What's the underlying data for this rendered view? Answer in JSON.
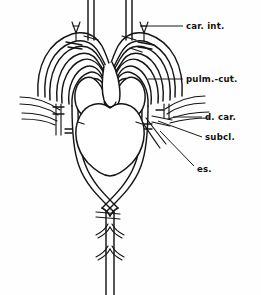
{
  "figure": {
    "background_color": "#fefefe",
    "line_color": "#151515",
    "width": 261,
    "height": 295
  },
  "labels": [
    {
      "id": "car-int",
      "text": "car. int.",
      "x": 186,
      "y": 26,
      "leader_from_x": 183,
      "leader_from_y": 26,
      "leader_to_x": 140,
      "leader_to_y": 26
    },
    {
      "id": "pulm-cut",
      "text": "pulm.-cut.",
      "x": 186,
      "y": 79,
      "leader_from_x": 183,
      "leader_from_y": 79,
      "leader_to_x": 148,
      "leader_to_y": 79
    },
    {
      "id": "d-car",
      "text": "d. car.",
      "x": 205,
      "y": 117,
      "leader_from_x": 202,
      "leader_from_y": 117,
      "leader_to_x": 173,
      "leader_to_y": 117
    },
    {
      "id": "subcl",
      "text": "subcl.",
      "x": 205,
      "y": 137,
      "leader_from_x": 202,
      "leader_from_y": 137,
      "leader_to_x": 158,
      "leader_to_y": 121
    },
    {
      "id": "es",
      "text": "es.",
      "x": 197,
      "y": 169,
      "leader_from_x": 194,
      "leader_from_y": 166,
      "leader_to_x": 160,
      "leader_to_y": 131
    }
  ],
  "structures": {
    "heart_ventricle": "ventricle",
    "heart_left_atrium": "left-atrium",
    "heart_right_atrium": "right-atrium",
    "conus_arteriosus": "conus-arteriosus",
    "dorsal_aorta": "dorsal-aorta",
    "aortic_arches": "aortic-arches",
    "carotid_gland": "carotid-gland",
    "segmental_arteries": "segmental-arteries"
  }
}
